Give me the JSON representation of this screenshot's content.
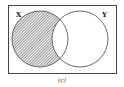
{
  "diagram": {
    "type": "venn",
    "sets": [
      {
        "name": "X",
        "label": "X"
      },
      {
        "name": "Y",
        "label": "Y"
      }
    ],
    "shaded_region": "X only (X minus Y)",
    "caption": "(c)"
  },
  "colors": {
    "stroke": "#444444",
    "hatch": "#555555",
    "background": "#ffffff"
  }
}
